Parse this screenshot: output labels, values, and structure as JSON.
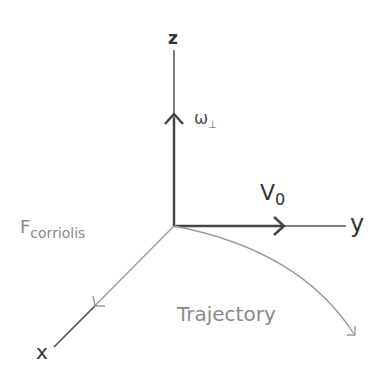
{
  "diagram": {
    "axes": {
      "z_label": "z",
      "y_label": "y",
      "x_label": "x"
    },
    "vectors": {
      "omega_label": "ω",
      "omega_subscript": "⊥",
      "velocity_label": "V",
      "velocity_subscript": "0"
    },
    "force_label": "F",
    "force_subscript": "corriolis",
    "trajectory_label": "Trajectory",
    "colors": {
      "axis_dark": "#444444",
      "axis_light": "#999999",
      "text_light": "#8a8a8a"
    }
  }
}
